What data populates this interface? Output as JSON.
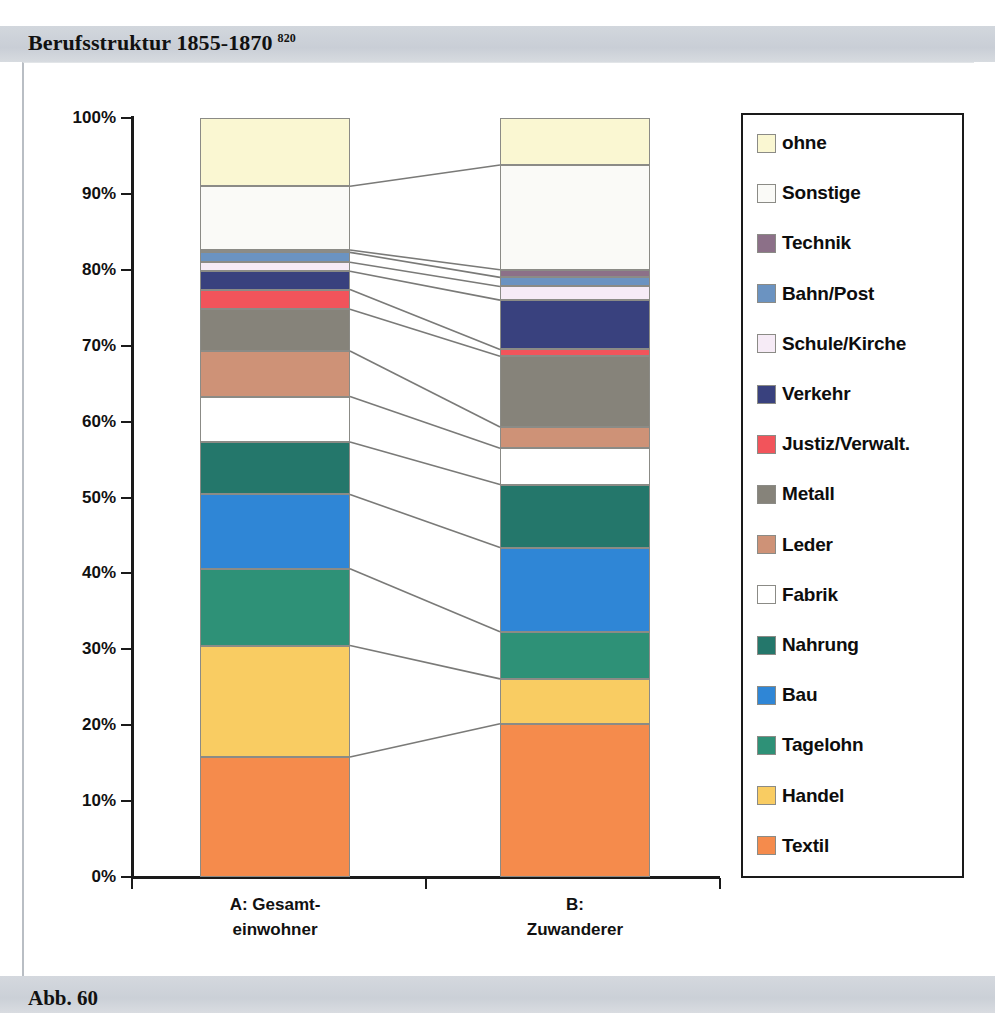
{
  "title": {
    "text": "Berufsstruktur 1855-1870",
    "footnote": "820"
  },
  "footer": {
    "text": "Abb. 60"
  },
  "chart_data": {
    "type": "bar",
    "stacked": true,
    "normalized": true,
    "title": "Berufsstruktur 1855-1870",
    "xlabel": "",
    "ylabel": "",
    "ylim": [
      0,
      100
    ],
    "grid": false,
    "legend_position": "right",
    "categories": [
      "A: Gesamt-einwohner",
      "B: Zuwanderer"
    ],
    "category_labels": [
      {
        "line1": "A: Gesamt-",
        "line2": "einwohner"
      },
      {
        "line1": "B:",
        "line2": "Zuwanderer"
      }
    ],
    "ytick_labels": [
      "100%",
      "90%",
      "80%",
      "70%",
      "60%",
      "50%",
      "40%",
      "30%",
      "20%",
      "10%",
      "0%"
    ],
    "ytick_values": [
      100,
      90,
      80,
      70,
      60,
      50,
      40,
      30,
      20,
      10,
      0
    ],
    "series": [
      {
        "name": "Textil",
        "color": "#F58B4C",
        "values": [
          15.8,
          20.2
        ]
      },
      {
        "name": "Handel",
        "color": "#F9CC62",
        "values": [
          14.7,
          5.9
        ]
      },
      {
        "name": "Tagelohn",
        "color": "#2E9177",
        "values": [
          10.1,
          6.2
        ]
      },
      {
        "name": "Bau",
        "color": "#2F86D6",
        "values": [
          9.8,
          11.1
        ]
      },
      {
        "name": "Nahrung",
        "color": "#24776B",
        "values": [
          6.9,
          8.3
        ]
      },
      {
        "name": "Fabrik",
        "color": "#FFFFFF",
        "values": [
          6.0,
          4.8
        ]
      },
      {
        "name": "Leder",
        "color": "#CE9277",
        "values": [
          6.0,
          2.8
        ]
      },
      {
        "name": "Metall",
        "color": "#86837A",
        "values": [
          5.5,
          9.3
        ]
      },
      {
        "name": "Justiz/Verwalt.",
        "color": "#F2545B",
        "values": [
          2.6,
          0.9
        ]
      },
      {
        "name": "Verkehr",
        "color": "#39417E",
        "values": [
          2.4,
          6.5
        ]
      },
      {
        "name": "Schule/Kirche",
        "color": "#F6EBF6",
        "values": [
          1.2,
          1.8
        ]
      },
      {
        "name": "Bahn/Post",
        "color": "#6B93C1",
        "values": [
          1.3,
          1.2
        ]
      },
      {
        "name": "Technik",
        "color": "#8C7088",
        "values": [
          0.3,
          1.0
        ]
      },
      {
        "name": "Sonstige",
        "color": "#FAFAF7",
        "values": [
          8.4,
          13.8
        ]
      },
      {
        "name": "ohne",
        "color": "#FAF7D2",
        "values": [
          9.0,
          6.2
        ]
      }
    ],
    "cumulative_boundaries": {
      "A: Gesamt-einwohner": [
        0,
        15.8,
        30.5,
        40.6,
        50.4,
        57.3,
        63.3,
        69.3,
        74.8,
        77.4,
        79.8,
        81.0,
        82.3,
        82.6,
        91.0,
        100
      ],
      "B: Zuwanderer": [
        0,
        20.2,
        26.1,
        32.3,
        43.4,
        51.7,
        56.5,
        59.3,
        68.6,
        69.5,
        76.0,
        77.8,
        79.0,
        80.0,
        93.8,
        100
      ]
    }
  },
  "legend": {
    "items": [
      {
        "label": "ohne",
        "color": "#FAF7D2"
      },
      {
        "label": "Sonstige",
        "color": "#FAFAF7"
      },
      {
        "label": "Technik",
        "color": "#8C7088"
      },
      {
        "label": "Bahn/Post",
        "color": "#6B93C1"
      },
      {
        "label": "Schule/Kirche",
        "color": "#F6EBF6"
      },
      {
        "label": "Verkehr",
        "color": "#39417E"
      },
      {
        "label": "Justiz/Verwalt.",
        "color": "#F2545B"
      },
      {
        "label": "Metall",
        "color": "#86837A"
      },
      {
        "label": "Leder",
        "color": "#CE9277"
      },
      {
        "label": "Fabrik",
        "color": "#FFFFFF"
      },
      {
        "label": "Nahrung",
        "color": "#24776B"
      },
      {
        "label": "Bau",
        "color": "#2F86D6"
      },
      {
        "label": "Tagelohn",
        "color": "#2E9177"
      },
      {
        "label": "Handel",
        "color": "#F9CC62"
      },
      {
        "label": "Textil",
        "color": "#F58B4C"
      }
    ]
  },
  "colors": {
    "band_background": "#cfd4da",
    "axis": "#1a1a1a",
    "segment_border": "#8b8b86",
    "connector": "#7a7a78"
  }
}
